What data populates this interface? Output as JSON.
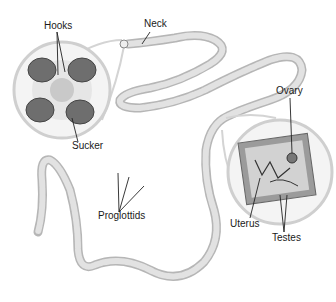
{
  "diagram": {
    "labels": {
      "hooks": "Hooks",
      "neck": "Neck",
      "sucker": "Sucker",
      "ovary": "Ovary",
      "proglottids": "Proglottids",
      "uterus": "Uterus",
      "testes": "Testes"
    },
    "colors": {
      "body": "#d9d9d9",
      "body_outline": "#a8a8a8",
      "inset_ring": "#c8c8c8",
      "sucker": "#6a6a6a",
      "leader_line": "#222222"
    }
  }
}
